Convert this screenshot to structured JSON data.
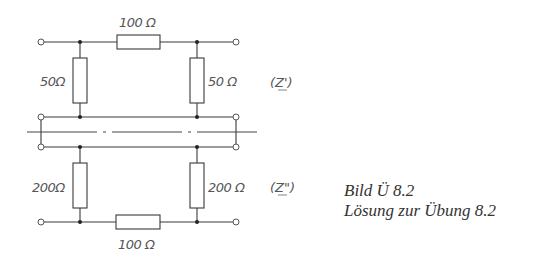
{
  "diagram": {
    "upper_network": {
      "series_resistor": "100 Ω",
      "shunt_left": "50Ω",
      "shunt_right": "50 Ω",
      "impedance_label": "(Z')"
    },
    "lower_network": {
      "series_resistor": "100 Ω",
      "shunt_left": "200Ω",
      "shunt_right": "200 Ω",
      "impedance_label": "(Z\")"
    },
    "symmetry_axis": "dash-dot",
    "colors": {
      "line": "#3a3a3a",
      "label": "#555555",
      "background": "#ffffff"
    }
  },
  "caption": {
    "title": "Bild Ü 8.2",
    "subtitle": "Lösung zur Übung 8.2"
  }
}
